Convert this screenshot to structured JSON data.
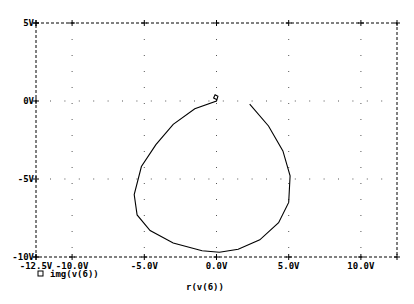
{
  "chart_data": {
    "type": "line",
    "title": "",
    "xlabel": "r(v(6))",
    "ylabel": "",
    "xlim": [
      -12.5,
      12.5
    ],
    "ylim": [
      -10,
      5
    ],
    "grid": true,
    "x_ticks": [
      "-12.5V",
      "-10.0V",
      "-5.0V",
      "0.0V",
      "5.0V",
      "10.0V"
    ],
    "y_ticks": [
      "5V",
      "0V",
      "-5V",
      "-10V"
    ],
    "legend": [
      {
        "marker": "square",
        "label": "img(v(6))"
      }
    ],
    "series": [
      {
        "name": "img(v(6))",
        "x": [
          0.0,
          -0.2,
          -0.1,
          0.1,
          0.0,
          -1.5,
          -3.0,
          -4.2,
          -5.2,
          -5.7,
          -5.5,
          -4.6,
          -3.0,
          -1.0,
          0.2,
          1.5,
          3.0,
          4.3,
          5.0,
          5.1,
          4.6,
          3.6,
          2.3
        ],
        "y": [
          0.1,
          0.2,
          0.4,
          0.3,
          0.0,
          -0.5,
          -1.5,
          -2.8,
          -4.2,
          -6.0,
          -7.3,
          -8.3,
          -9.1,
          -9.6,
          -9.7,
          -9.5,
          -8.9,
          -7.8,
          -6.5,
          -4.8,
          -3.2,
          -1.6,
          -0.2
        ]
      }
    ]
  },
  "axes": {
    "x_label": "r(v(6))",
    "legend_label": "img(v(6))",
    "x_ticks": [
      "-12.5V",
      "-10.0V",
      "-5.0V",
      "0.0V",
      "5.0V",
      "10.0V"
    ],
    "y_ticks": [
      "5V",
      "0V",
      "-5V",
      "-10V"
    ]
  }
}
